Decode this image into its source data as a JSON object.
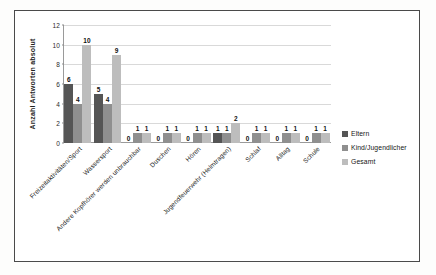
{
  "figure": {
    "background_color": "#ffffff",
    "frame_color": "#4a4a4a"
  },
  "chart_data": {
    "type": "bar",
    "title": "",
    "xlabel": "",
    "ylabel": "Anzahl Antworten absolut",
    "ylim": [
      0,
      12
    ],
    "yticks": [
      0,
      2,
      4,
      6,
      8,
      10,
      12
    ],
    "grid": true,
    "legend_position": "right",
    "categories": [
      "Freizeitaktivitäten/Sport",
      "Wassersport",
      "Andere Kopfhörer werden unbrauchbar",
      "Duschen",
      "Hören",
      "Jugendfeuerwehr (Helmtragen)",
      "Schlaf",
      "Alltag",
      "Schule"
    ],
    "series": [
      {
        "name": "Eltern",
        "color": "#555555",
        "values": [
          6,
          5,
          0,
          0,
          0,
          1,
          0,
          0,
          0
        ]
      },
      {
        "name": "Kind/Jugendlicher",
        "color": "#8f8f8f",
        "values": [
          4,
          4,
          1,
          1,
          1,
          1,
          1,
          1,
          1
        ]
      },
      {
        "name": "Gesamt",
        "color": "#bdbdbd",
        "values": [
          10,
          9,
          1,
          1,
          1,
          2,
          1,
          1,
          1
        ]
      }
    ]
  }
}
